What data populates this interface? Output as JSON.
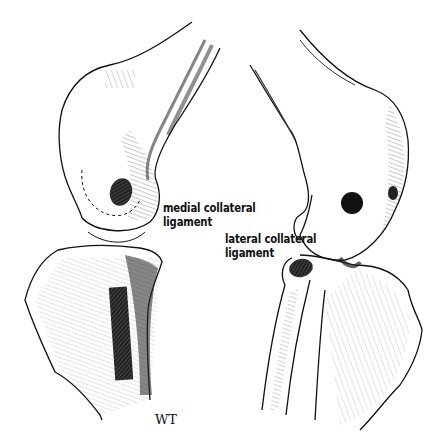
{
  "figure": {
    "views": [
      {
        "side": "left",
        "name": "medial view"
      },
      {
        "side": "right",
        "name": "lateral view"
      }
    ]
  },
  "labels": {
    "medial_line1": "medial collateral",
    "medial_line2": "ligament",
    "lateral_line1": "lateral collateral",
    "lateral_line2": "ligament"
  },
  "signature": "WT",
  "colors": {
    "ink": "#111111",
    "background": "#ffffff"
  }
}
